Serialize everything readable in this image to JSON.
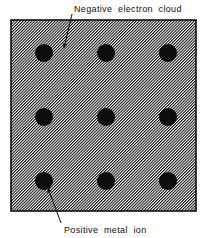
{
  "figure": {
    "background_color": "#ffffff",
    "ink_color": "#101010"
  },
  "diagram": {
    "box": {
      "name": "electron-cloud-region",
      "x": 11,
      "y": 20,
      "width": 185,
      "height": 191,
      "border_color": "#101010",
      "border_width": 1.6,
      "fill_description": "fine diagonal hatching",
      "hatch_color": "#111111",
      "hatch_background": "#ffffff",
      "hatch_angle_degrees": 45,
      "hatch_spacing_px": 2
    },
    "ions": {
      "label": "Positive metal ion",
      "color": "#0d0d0d",
      "radius": 9,
      "rows": 3,
      "columns": 3,
      "centers_x": [
        44,
        106,
        168
      ],
      "centers_y": [
        53,
        117,
        181
      ],
      "count": 9
    }
  },
  "annotations": [
    {
      "id": "negative-electron-cloud",
      "text": "Negative  electron  cloud",
      "text_x": 74,
      "text_y": 12,
      "leader": {
        "from_x": 72,
        "from_y": 14,
        "to_x": 64,
        "to_y": 48,
        "arrow_at": "end"
      }
    },
    {
      "id": "positive-metal-ion",
      "text": "Positive  metal  ion",
      "text_x": 64,
      "text_y": 233,
      "leader": {
        "from_x": 61,
        "from_y": 223,
        "to_x": 48,
        "to_y": 188,
        "arrow_at": "end"
      }
    }
  ]
}
